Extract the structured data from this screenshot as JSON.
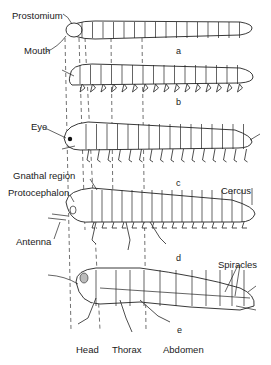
{
  "figure": {
    "stages": [
      {
        "id": "a",
        "label": "a"
      },
      {
        "id": "b",
        "label": "b"
      },
      {
        "id": "c",
        "label": "c"
      },
      {
        "id": "d",
        "label": "d"
      },
      {
        "id": "e",
        "label": "e"
      }
    ],
    "annotations": {
      "prostomium": "Prostomium",
      "mouth": "Mouth",
      "eye": "Eye",
      "gnathal_region": "Gnathal region",
      "protocephalon": "Protocephalon",
      "antenna": "Antenna",
      "cercus": "Cercus",
      "spiracles": "Spiracles"
    },
    "regions": {
      "head": "Head",
      "thorax": "Thorax",
      "abdomen": "Abdomen"
    }
  }
}
